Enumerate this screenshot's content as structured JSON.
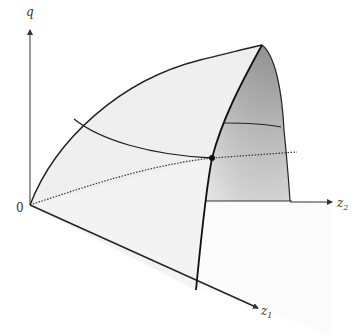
{
  "diagram": {
    "type": "3d-surface-illustration",
    "axes": {
      "vertical": {
        "label": "q"
      },
      "horizontal": {
        "label": "z",
        "subscript": "2"
      },
      "diagonal": {
        "label": "z",
        "subscript": "1"
      },
      "origin": {
        "label": "0"
      }
    },
    "surface": {
      "front_face_color": "#f0f0f0",
      "side_face_color_light": "#d8d8d8",
      "side_face_color_dark": "#9a9a9a",
      "floor_color": "#fafafa",
      "edge_color": "#222222"
    },
    "marked_point": {
      "color": "#111111"
    },
    "dotted_line": {
      "style": "dotted",
      "color": "#333333"
    }
  }
}
